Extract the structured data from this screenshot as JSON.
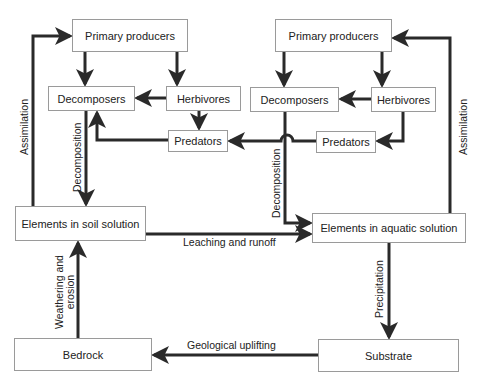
{
  "terrestrial": {
    "primary_producers": "Primary producers",
    "decomposers": "Decomposers",
    "herbivores": "Herbivores",
    "predators": "Predators",
    "elements": "Elements in soil solution",
    "bedrock": "Bedrock"
  },
  "aquatic": {
    "primary_producers": "Primary producers",
    "decomposers": "Decomposers",
    "herbivores": "Herbivores",
    "predators": "Predators",
    "elements": "Elements in aquatic solution",
    "substrate": "Substrate"
  },
  "flows": {
    "assimilation_left": "Assimilation",
    "assimilation_right": "Assimilation",
    "decomposition_left": "Decomposition",
    "decomposition_right": "Decomposition",
    "leaching": "Leaching and runoff",
    "weathering_line1": "Weathering and",
    "weathering_line2": "erosion",
    "precipitation": "Precipitation",
    "uplifting": "Geological uplifting"
  },
  "colors": {
    "arrow": "#2a2a2a",
    "box_border": "#9a9a9a"
  }
}
